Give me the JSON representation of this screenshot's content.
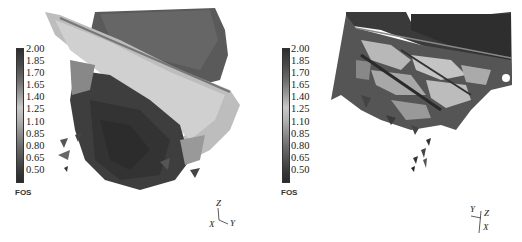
{
  "figure": {
    "panels": [
      {
        "id": "left",
        "colorbar": {
          "title": "FOS",
          "ticks": [
            "2.00",
            "1.85",
            "1.70",
            "1.65",
            "1.40",
            "1.25",
            "1.10",
            "0.85",
            "0.80",
            "0.65",
            "0.50"
          ]
        },
        "axes_triad": {
          "x": "X",
          "y": "Y",
          "z": "Z"
        }
      },
      {
        "id": "right",
        "colorbar": {
          "title": "FOS",
          "ticks": [
            "2.00",
            "1.85",
            "1.70",
            "1.65",
            "1.40",
            "1.25",
            "1.10",
            "0.85",
            "0.80",
            "0.65",
            "0.50"
          ]
        },
        "axes_triad": {
          "x": "X",
          "y": "Y",
          "z": "Z"
        }
      }
    ],
    "colors": {
      "low": "#2a2a2a",
      "mid": "#c8c8c8",
      "high": "#2e2e2e",
      "background": "#ffffff"
    }
  }
}
